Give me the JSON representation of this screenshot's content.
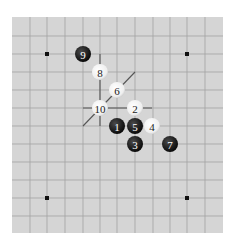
{
  "diagram": {
    "type": "go-board-fragment",
    "board": {
      "x": 12,
      "y": 17,
      "width": 211,
      "height": 216,
      "background": "#d5d5d5",
      "line_color": "#a2a2a2",
      "vertical_lines_x": [
        30,
        47,
        65,
        83,
        100,
        117,
        135,
        153,
        170,
        187,
        205
      ],
      "horizontal_lines_y": [
        36,
        54,
        72,
        90,
        108,
        126,
        144,
        162,
        180,
        198,
        216
      ]
    },
    "star_points": [
      {
        "x": 47,
        "y": 54
      },
      {
        "x": 187,
        "y": 54
      },
      {
        "x": 47,
        "y": 198
      },
      {
        "x": 187,
        "y": 198
      }
    ],
    "annotation_lines": [
      {
        "name": "vertical-mark-line",
        "x1": 100,
        "y1": 54,
        "x2": 100,
        "y2": 126
      },
      {
        "name": "horizontal-mark-line",
        "x1": 83,
        "y1": 108,
        "x2": 152,
        "y2": 108
      },
      {
        "name": "diagonal-mark-line",
        "x1": 83,
        "y1": 126,
        "x2": 135,
        "y2": 72
      }
    ],
    "stones": [
      {
        "move": "1",
        "color": "black",
        "x": 117,
        "y": 126
      },
      {
        "move": "2",
        "color": "white",
        "x": 135,
        "y": 108
      },
      {
        "move": "3",
        "color": "black",
        "x": 135,
        "y": 144
      },
      {
        "move": "4",
        "color": "white",
        "x": 152,
        "y": 126
      },
      {
        "move": "5",
        "color": "black",
        "x": 135,
        "y": 126
      },
      {
        "move": "6",
        "color": "white",
        "x": 117,
        "y": 90
      },
      {
        "move": "7",
        "color": "black",
        "x": 170,
        "y": 144
      },
      {
        "move": "8",
        "color": "white",
        "x": 100,
        "y": 72
      },
      {
        "move": "9",
        "color": "black",
        "x": 83,
        "y": 54
      },
      {
        "move": "10",
        "color": "white",
        "x": 100,
        "y": 108
      }
    ]
  }
}
